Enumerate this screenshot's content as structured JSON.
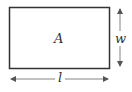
{
  "figure": {
    "type": "rectangle-dimension-diagram",
    "area_label": "A",
    "width_label": "w",
    "length_label": "l",
    "colors": {
      "stroke": "#333333",
      "arrow": "#555555",
      "background": "#ffffff"
    }
  }
}
